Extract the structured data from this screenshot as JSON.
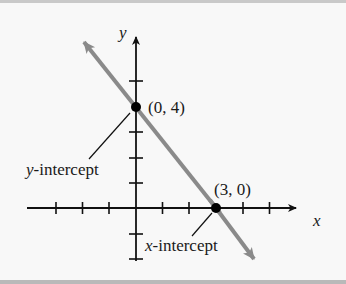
{
  "diagram": {
    "type": "coordinate-plane",
    "axes": {
      "x_label": "x",
      "y_label": "y",
      "x_ticks": [
        -4,
        -3,
        -2,
        -1,
        1,
        2,
        3,
        4,
        5
      ],
      "y_ticks": [
        -2,
        -1,
        1,
        2,
        3,
        4,
        5
      ]
    },
    "line": {
      "color": "#8a8a8a",
      "through": [
        [
          0,
          4
        ],
        [
          3,
          0
        ]
      ],
      "direction": "both arrows"
    },
    "points": [
      {
        "label": "(0, 4)",
        "x": 0,
        "y": 4
      },
      {
        "label": "(3, 0)",
        "x": 3,
        "y": 0
      }
    ],
    "annotations": [
      {
        "var": "y",
        "rest": "-intercept",
        "points_to": "(0, 4)"
      },
      {
        "var": "x",
        "rest": "-intercept",
        "points_to": "(3, 0)"
      }
    ]
  }
}
